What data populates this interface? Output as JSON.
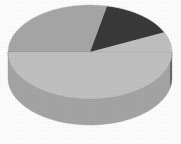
{
  "chart_data": {
    "type": "pie",
    "title": "",
    "subtitle": "",
    "xlabel": "",
    "ylabel": "",
    "three_d": true,
    "legend": "none",
    "grid": false,
    "labels_shown": false,
    "categories": [
      "Series 1",
      "Series 2",
      "Series 3"
    ],
    "values": [
      57,
      28,
      15
    ],
    "percentages": [
      "57%",
      "28%",
      "15%"
    ],
    "colors": [
      "#c2c2c2",
      "#a8a8a8",
      "#3a3a3a"
    ],
    "slices": [
      {
        "name": "Series 1",
        "value": 57,
        "percent": "57%",
        "color": "#c2c2c2",
        "side_color": "#a6a6a6",
        "start_angle_deg": 180,
        "end_angle_deg": 385,
        "position": "bottom"
      },
      {
        "name": "Series 2",
        "value": 28,
        "percent": "28%",
        "color": "#a8a8a8",
        "side_color": "#8f8f8f",
        "start_angle_deg": 78,
        "end_angle_deg": 180,
        "position": "upper-left"
      },
      {
        "name": "Series 3",
        "value": 15,
        "percent": "15%",
        "color": "#3a3a3a",
        "side_color": "#5a5a5a",
        "start_angle_deg": 25,
        "end_angle_deg": 78,
        "position": "upper-right"
      }
    ],
    "geometry": {
      "center_x": 90,
      "center_y": 52,
      "radius_x": 82,
      "radius_y": 47,
      "depth_px": 26
    },
    "background_color": "#ffffff",
    "outline_color": "#9a9a9a"
  },
  "figure": {
    "canvas_width": "181",
    "canvas_height": "144"
  }
}
